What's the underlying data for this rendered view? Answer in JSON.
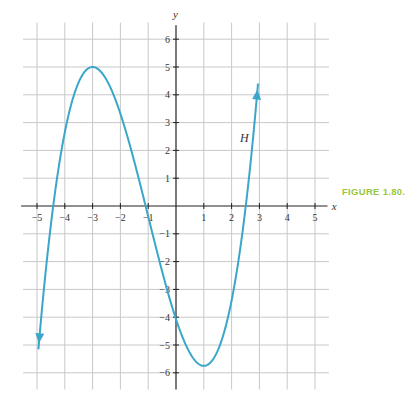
{
  "chart_data": {
    "type": "line",
    "title": "",
    "xlabel": "x",
    "ylabel": "y",
    "xlim": [
      -5.4,
      5.4
    ],
    "ylim": [
      -6.4,
      6.4
    ],
    "grid": true,
    "x_ticks": [
      -5,
      -4,
      -3,
      -2,
      -1,
      1,
      2,
      3,
      4,
      5
    ],
    "y_ticks": [
      -6,
      -5,
      -4,
      -3,
      -2,
      -1,
      1,
      2,
      3,
      4,
      5,
      6
    ],
    "series": [
      {
        "name": "H",
        "color": "#3aa6c9",
        "description": "Cubic curve with arrowheads at both ends",
        "x": [
          -4.95,
          -4.4,
          -4,
          -3,
          -2,
          -1,
          0,
          1,
          2,
          2.5,
          2.95
        ],
        "y": [
          -5.5,
          0,
          2.4,
          5,
          3.9,
          0.1,
          -4.1,
          -5.75,
          -2.8,
          0.4,
          5.0
        ],
        "local_max": [
          -3,
          5
        ],
        "local_min": [
          1,
          -5.75
        ],
        "x_intercepts": [
          -4.4,
          -1,
          2.5
        ],
        "y_intercept": -4.1,
        "label": "H",
        "label_position": [
          2.3,
          2.3
        ]
      }
    ],
    "legend": "none"
  },
  "figure": {
    "caption": "FIGURE 1.80.",
    "caption_color": "#9bc63b",
    "curve_label": "H",
    "axis_x_label": "x",
    "axis_y_label": "y"
  }
}
